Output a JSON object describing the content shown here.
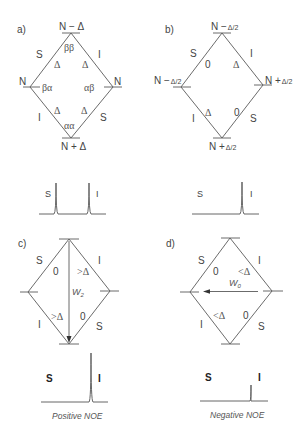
{
  "panels": {
    "a": {
      "label": "a)",
      "levels": {
        "top": "N − Δ",
        "left": "N",
        "right": "N",
        "bottom": "N + Δ"
      },
      "states": {
        "top": "ββ",
        "left": "βα",
        "right": "αβ",
        "bottom": "αα"
      },
      "edges": {
        "upper_left": {
          "spin": "S",
          "rate": "Δ"
        },
        "upper_right": {
          "spin": "I",
          "rate": "Δ"
        },
        "lower_left": {
          "spin": "I",
          "rate": "Δ"
        },
        "lower_right": {
          "spin": "S",
          "rate": "Δ"
        }
      },
      "spectrum": {
        "S": "S",
        "I": "I",
        "peaks": [
          {
            "name": "S",
            "height": 1.0
          },
          {
            "name": "I",
            "height": 1.0
          }
        ]
      }
    },
    "b": {
      "label": "b)",
      "levels": {
        "top_main": "N −",
        "top_frac": "Δ/2",
        "left_main": "N −",
        "left_frac": "Δ/2",
        "right_main": "N +",
        "right_frac": "Δ/2",
        "bottom_main": "N +",
        "bottom_frac": "Δ/2"
      },
      "edges": {
        "upper_left": {
          "spin": "S",
          "rate": "0"
        },
        "upper_right": {
          "spin": "I",
          "rate": "Δ"
        },
        "lower_left": {
          "spin": "I",
          "rate": "Δ"
        },
        "lower_right": {
          "spin": "S",
          "rate": "0"
        }
      },
      "spectrum": {
        "S": "S",
        "I": "I",
        "peaks": [
          {
            "name": "S",
            "height": 0.0
          },
          {
            "name": "I",
            "height": 1.0
          }
        ]
      }
    },
    "c": {
      "label": "c)",
      "edges": {
        "upper_left": {
          "spin": "S",
          "rate": "0"
        },
        "upper_right": {
          "spin": "I",
          "rate": ">Δ"
        },
        "lower_left": {
          "spin": "I",
          "rate": ">Δ"
        },
        "lower_right": {
          "spin": "S",
          "rate": "0"
        }
      },
      "cross_relaxation": {
        "symbol": "W",
        "subscript": "2",
        "direction": "top-to-bottom"
      },
      "spectrum": {
        "S": "S",
        "I": "I",
        "peaks": [
          {
            "name": "S",
            "height": 0.0
          },
          {
            "name": "I",
            "height": 1.5
          }
        ]
      },
      "caption": "Positive NOE"
    },
    "d": {
      "label": "d)",
      "edges": {
        "upper_left": {
          "spin": "S",
          "rate": "0"
        },
        "upper_right": {
          "spin": "I",
          "rate": "<Δ"
        },
        "lower_left": {
          "spin": "I",
          "rate": "<Δ"
        },
        "lower_right": {
          "spin": "S",
          "rate": "0"
        }
      },
      "cross_relaxation": {
        "symbol": "W",
        "subscript": "0",
        "direction": "right-to-left"
      },
      "spectrum": {
        "S": "S",
        "I": "I",
        "peaks": [
          {
            "name": "S",
            "height": 0.0
          },
          {
            "name": "I",
            "height": 0.5
          }
        ]
      },
      "caption": "Negative NOE"
    }
  }
}
